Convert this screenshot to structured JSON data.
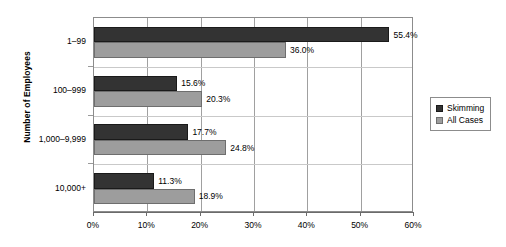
{
  "chart_data": {
    "type": "bar",
    "orientation": "horizontal",
    "title": "",
    "xlabel": "",
    "ylabel": "Number of Employees",
    "categories": [
      "1–99",
      "100–999",
      "1,000–9,999",
      "10,000+"
    ],
    "series": [
      {
        "name": "Skimming",
        "color": "#333333",
        "values": [
          55.4,
          15.6,
          17.7,
          11.3
        ],
        "labels": [
          "55.4%",
          "15.6%",
          "17.7%",
          "11.3%"
        ]
      },
      {
        "name": "All Cases",
        "color": "#9d9d9d",
        "values": [
          36.0,
          20.3,
          24.8,
          18.9
        ],
        "labels": [
          "36.0%",
          "20.3%",
          "24.8%",
          "18.9%"
        ]
      }
    ],
    "xlim": [
      0,
      60
    ],
    "xticks": [
      0,
      10,
      20,
      30,
      40,
      50,
      60
    ],
    "xtick_labels": [
      "0%",
      "10%",
      "20%",
      "30%",
      "40%",
      "50%",
      "60%"
    ],
    "grid": "vertical",
    "legend_position": "right",
    "legend_entries": [
      "Skimming",
      "All Cases"
    ]
  }
}
